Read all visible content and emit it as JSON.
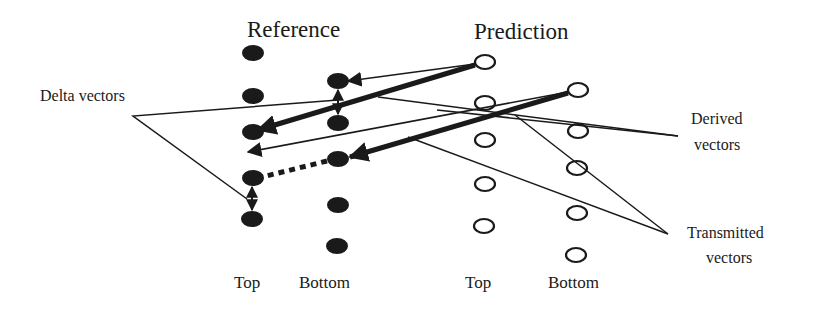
{
  "headings": {
    "reference": "Reference",
    "prediction": "Prediction"
  },
  "columns": {
    "ref_top": "Top",
    "ref_bottom": "Bottom",
    "pred_top": "Top",
    "pred_bottom": "Bottom"
  },
  "annotations": {
    "delta": "Delta vectors",
    "derived_line1": "Derived",
    "derived_line2": "vectors",
    "transmitted_line1": "Transmitted",
    "transmitted_line2": "vectors"
  },
  "colors": {
    "ink": "#1a1a1a",
    "background": "#ffffff"
  },
  "nodes": {
    "reference_top": {
      "fill": "filled",
      "count": 5
    },
    "reference_bottom": {
      "fill": "filled",
      "count": 5
    },
    "prediction_top": {
      "fill": "hollow",
      "count": 5
    },
    "prediction_bottom": {
      "fill": "hollow",
      "count": 5
    }
  }
}
